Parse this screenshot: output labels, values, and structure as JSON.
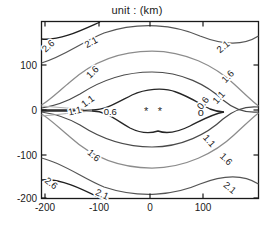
{
  "chart_data": {
    "type": "contour",
    "title": "unit : (km)",
    "xlabel": "",
    "ylabel": "",
    "xlim": [
      -220,
      180
    ],
    "ylim": [
      -200,
      170
    ],
    "xticks": [
      -200,
      -100,
      0,
      100
    ],
    "yticks": [
      100,
      0,
      -100,
      -200
    ],
    "xtick_labels": [
      "-200",
      "-100",
      "0",
      "100"
    ],
    "ytick_labels": [
      "100",
      "0",
      "-100",
      "-200"
    ],
    "grid": false,
    "legend": "none",
    "contour_levels": [
      0.6,
      1.1,
      1.6,
      2.1,
      2.6
    ],
    "level_colors": {
      "0.6": "#262626",
      "1.1": "#4a4a4a",
      "1.6": "#8c8c8c",
      "2.1": "#555555",
      "2.6": "#1f1f1f"
    },
    "contour_labels": [
      {
        "text": "2.6",
        "x": -193,
        "y": 142,
        "rotation": -42
      },
      {
        "text": "2.1",
        "x": -112,
        "y": 150,
        "rotation": -28
      },
      {
        "text": "1.6",
        "x": -109,
        "y": 83,
        "rotation": -44
      },
      {
        "text": "1.1",
        "x": -118,
        "y": 17,
        "rotation": -36
      },
      {
        "text": "1.1",
        "x": -143,
        "y": -5,
        "rotation": -12
      },
      {
        "text": "0.6",
        "x": -76,
        "y": -8,
        "rotation": 0
      },
      {
        "text": "0.6",
        "x": 101,
        "y": 13,
        "rotation": -52
      },
      {
        "text": "1.1",
        "x": 131,
        "y": 26,
        "rotation": -48
      },
      {
        "text": "1.6",
        "x": 148,
        "y": 73,
        "rotation": -46
      },
      {
        "text": "2.1",
        "x": 139,
        "y": 140,
        "rotation": -40
      },
      {
        "text": "1.6",
        "x": -108,
        "y": -105,
        "rotation": 40
      },
      {
        "text": "2.6",
        "x": -189,
        "y": -168,
        "rotation": 38
      },
      {
        "text": "2.1",
        "x": -92,
        "y": -193,
        "rotation": 24
      },
      {
        "text": "1.1",
        "x": 111,
        "y": -72,
        "rotation": 48
      },
      {
        "text": "1.6",
        "x": 143,
        "y": -113,
        "rotation": 44
      },
      {
        "text": "2.1",
        "x": 150,
        "y": -178,
        "rotation": 40
      }
    ],
    "markers": [
      {
        "symbol": "*",
        "x": -8,
        "y": -6,
        "name": "star-marker-1"
      },
      {
        "symbol": "*",
        "x": 18,
        "y": -6,
        "name": "star-marker-2"
      },
      {
        "symbol": "o",
        "x": 96,
        "y": -8,
        "name": "circle-marker-1"
      }
    ],
    "axis_color": "#1a1a1a"
  }
}
